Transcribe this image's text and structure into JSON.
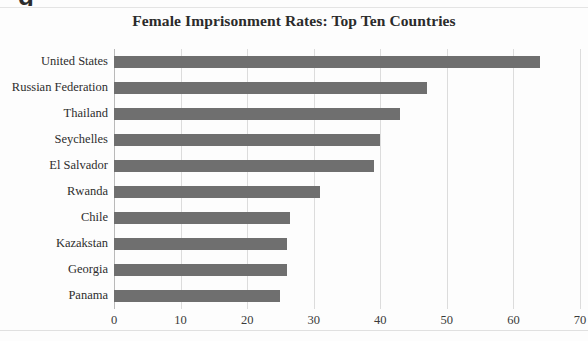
{
  "figure": {
    "scan_artifact_glyph": "g",
    "background_color": "#fdfdfd",
    "bar_color": "#6f6f6f",
    "gridline_color": "#dcdcdc",
    "axis_color": "#b9b9b9"
  },
  "chart_data": {
    "type": "bar",
    "orientation": "horizontal",
    "title": "Female Imprisonment Rates: Top Ten Countries",
    "xlabel": "",
    "ylabel": "",
    "categories": [
      "United States",
      "Russian Federation",
      "Thailand",
      "Seychelles",
      "El Salvador",
      "Rwanda",
      "Chile",
      "Kazakstan",
      "Georgia",
      "Panama"
    ],
    "values": [
      64,
      47,
      43,
      40,
      39,
      31,
      26.5,
      26,
      26,
      25
    ],
    "xlim": [
      0,
      70
    ],
    "xticks": [
      0,
      10,
      20,
      30,
      40,
      50,
      60,
      70
    ],
    "xtick_labels": [
      "0",
      "10",
      "20",
      "30",
      "40",
      "50",
      "60",
      "70"
    ],
    "grid": "vertical",
    "legend": null,
    "series": [
      {
        "name": "Female imprisonment rate",
        "values": [
          64,
          47,
          43,
          40,
          39,
          31,
          26.5,
          26,
          26,
          25
        ]
      }
    ]
  }
}
